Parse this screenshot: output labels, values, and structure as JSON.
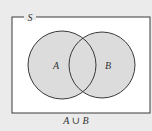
{
  "diagram": {
    "type": "venn",
    "universe_label": "S",
    "sets": [
      {
        "label": "A",
        "cx": 62,
        "cy": 65,
        "r": 34
      },
      {
        "label": "B",
        "cx": 102,
        "cy": 65,
        "r": 33
      }
    ],
    "shaded_region": "union",
    "caption": "A ∪ B",
    "colors": {
      "background": "#ebebeb",
      "frame_fill": "#ffffff",
      "shade": "#dcdcdc",
      "stroke": "#3a3a3a"
    }
  }
}
